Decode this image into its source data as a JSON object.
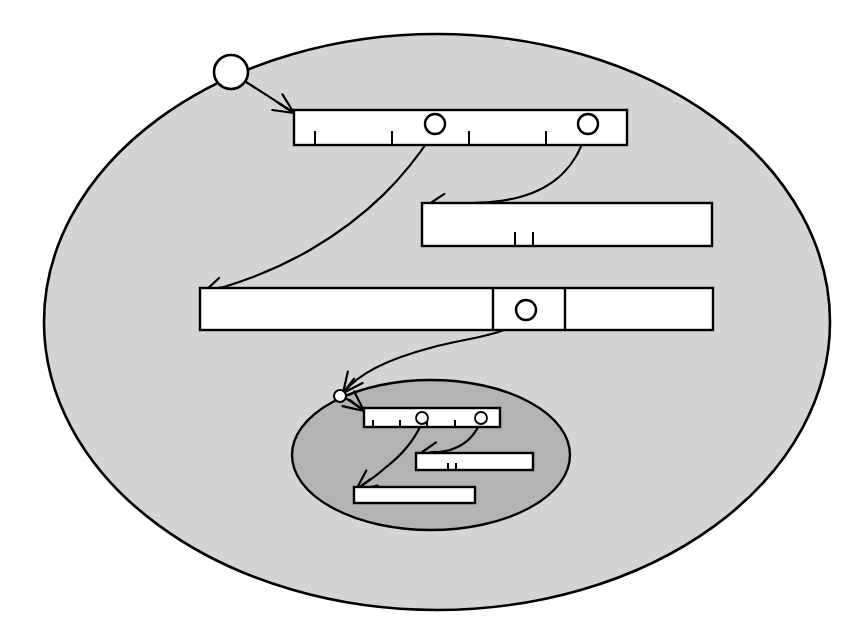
{
  "figure": {
    "name": "nested-activation-trace-diagram",
    "colors": {
      "page_background": "#ffffff",
      "outer_region_fill": "#d4d4d4",
      "inner_region_fill": "#b3b3b3",
      "bar_fill": "#ffffff",
      "stroke": "#000000"
    },
    "canvas": {
      "width": 866,
      "height": 634
    }
  },
  "outer_region": {
    "name": "outer-scope-ellipse",
    "cx": 437,
    "cy": 322,
    "rx": 393,
    "ry": 288
  },
  "inner_region": {
    "name": "inner-scope-ellipse",
    "cx": 431,
    "cy": 455,
    "rx": 139,
    "ry": 75
  },
  "entry_node": {
    "name": "entry-point-circle",
    "cx": 231,
    "cy": 72,
    "r": 17
  },
  "inner_entry_node": {
    "name": "inner-entry-point-circle",
    "cx": 340,
    "cy": 396,
    "r": 6
  },
  "outer_bars": [
    {
      "id": "outer-bar-1",
      "x": 294,
      "y": 110,
      "width": 333,
      "height": 35,
      "ticks": [
        315,
        392,
        469,
        546
      ],
      "dividers": [],
      "ports": [
        {
          "id": "outer-bar-1-port-a",
          "cx": 435,
          "cy": 124,
          "r": 10
        },
        {
          "id": "outer-bar-1-port-b",
          "cx": 588,
          "cy": 124,
          "r": 10
        }
      ]
    },
    {
      "id": "outer-bar-2",
      "x": 422,
      "y": 203,
      "width": 290,
      "height": 43,
      "ticks": [
        515,
        533
      ],
      "dividers": [],
      "ports": []
    },
    {
      "id": "outer-bar-3",
      "x": 200,
      "y": 288,
      "width": 513,
      "height": 42,
      "ticks": [],
      "dividers": [
        493,
        565
      ],
      "ports": [
        {
          "id": "outer-bar-3-port-a",
          "cx": 526,
          "cy": 310,
          "r": 10
        }
      ]
    }
  ],
  "inner_bars": [
    {
      "id": "inner-bar-1",
      "x": 364,
      "y": 408,
      "width": 136,
      "height": 19,
      "ticks": [
        373,
        400,
        427,
        455
      ],
      "dividers": [],
      "ports": [
        {
          "id": "inner-bar-1-port-a",
          "cx": 422,
          "cy": 418,
          "r": 6
        },
        {
          "id": "inner-bar-1-port-b",
          "cx": 481,
          "cy": 418,
          "r": 6
        }
      ]
    },
    {
      "id": "inner-bar-2",
      "x": 416,
      "y": 453,
      "width": 117,
      "height": 17,
      "ticks": [
        448,
        456
      ],
      "dividers": [],
      "ports": []
    },
    {
      "id": "inner-bar-3",
      "x": 354,
      "y": 487,
      "width": 121,
      "height": 16,
      "ticks": [],
      "dividers": [],
      "ports": []
    }
  ],
  "call_arrows": [
    {
      "id": "arrow-entry-to-bar1",
      "path": "M 246 82 C 262 92 274 100 294 113",
      "head": {
        "x": 294,
        "y": 113,
        "angle": 33
      }
    },
    {
      "id": "arrow-bar1a-to-bar3",
      "path": "M 432 135 C 406 175 370 215 310 250 C 270 273 235 284 204 293",
      "head": {
        "x": 203,
        "y": 293,
        "angle": 162
      }
    },
    {
      "id": "arrow-bar1b-to-bar2",
      "path": "M 585 135 C 578 160 560 186 520 197 C 490 205 460 202 427 206",
      "head": {
        "x": 426,
        "y": 206,
        "angle": 172
      }
    },
    {
      "id": "arrow-bar3-to-inner",
      "path": "M 522 320 C 500 337 470 337 430 348 C 392 358 360 372 344 392",
      "head": {
        "x": 343,
        "y": 393,
        "angle": 128
      }
    },
    {
      "id": "arrow-innerentry-to-innerbar1",
      "path": "M 347 399 C 353 403 358 406 364 411",
      "head": {
        "x": 364,
        "y": 411,
        "angle": 38
      }
    },
    {
      "id": "arrow-innerbar1a-to-innerbar3",
      "path": "M 421 425 C 414 440 402 455 385 468 C 374 478 365 483 357 489",
      "head": {
        "x": 356,
        "y": 490,
        "angle": 143
      }
    },
    {
      "id": "arrow-innerbar1b-to-innerbar2",
      "path": "M 479 425 C 474 436 466 445 450 450 C 438 453 428 452 419 455",
      "head": {
        "x": 418,
        "y": 455,
        "angle": 170
      }
    }
  ]
}
